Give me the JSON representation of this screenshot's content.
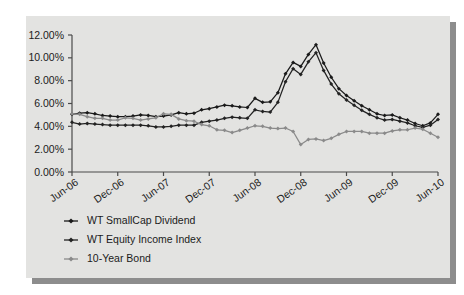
{
  "chart_data": {
    "type": "line",
    "title": "",
    "subtitle": "",
    "xlabel": "",
    "ylabel": "",
    "grid": false,
    "legend_position": "bottom-left",
    "ylim": [
      0,
      12
    ],
    "ytick_labels": [
      "0.00%",
      "2.00%",
      "4.00%",
      "6.00%",
      "8.00%",
      "10.00%",
      "12.00%"
    ],
    "ytick_values": [
      0,
      2,
      4,
      6,
      8,
      10,
      12
    ],
    "xtick_labels": [
      "Jun-06",
      "Dec-06",
      "Jun-07",
      "Dec-07",
      "Jun-08",
      "Dec-08",
      "Jun-09",
      "Dec-09",
      "Jun-10"
    ],
    "x": [
      "Jun-06",
      "Jul-06",
      "Aug-06",
      "Sep-06",
      "Oct-06",
      "Nov-06",
      "Dec-06",
      "Jan-07",
      "Feb-07",
      "Mar-07",
      "Apr-07",
      "May-07",
      "Jun-07",
      "Jul-07",
      "Aug-07",
      "Sep-07",
      "Oct-07",
      "Nov-07",
      "Dec-07",
      "Jan-08",
      "Feb-08",
      "Mar-08",
      "Apr-08",
      "May-08",
      "Jun-08",
      "Jul-08",
      "Aug-08",
      "Sep-08",
      "Oct-08",
      "Nov-08",
      "Dec-08",
      "Jan-09",
      "Feb-09",
      "Mar-09",
      "Apr-09",
      "May-09",
      "Jun-09",
      "Jul-09",
      "Aug-09",
      "Sep-09",
      "Oct-09",
      "Nov-09",
      "Dec-09",
      "Jan-10",
      "Feb-10",
      "Mar-10",
      "Apr-10",
      "May-10",
      "Jun-10"
    ],
    "series": [
      {
        "name": "WT SmallCap Dividend",
        "color": "#1a1a1a",
        "marker": "diamond",
        "values": [
          5.05,
          5.15,
          5.2,
          5.1,
          4.95,
          4.9,
          4.85,
          4.85,
          4.9,
          5.0,
          4.95,
          4.85,
          4.9,
          5.0,
          5.2,
          5.1,
          5.15,
          5.45,
          5.55,
          5.7,
          5.85,
          5.8,
          5.7,
          5.65,
          6.45,
          6.1,
          6.15,
          6.95,
          8.6,
          9.6,
          9.25,
          10.3,
          11.15,
          9.55,
          8.3,
          7.3,
          6.7,
          6.25,
          5.8,
          5.45,
          5.1,
          4.95,
          5.0,
          4.75,
          4.55,
          4.25,
          4.05,
          4.3,
          5.05
        ]
      },
      {
        "name": "WT Equity Income Index",
        "color": "#232323",
        "marker": "diamond",
        "values": [
          4.35,
          4.2,
          4.25,
          4.2,
          4.15,
          4.1,
          4.1,
          4.1,
          4.1,
          4.1,
          4.05,
          3.95,
          3.95,
          4.0,
          4.1,
          4.1,
          4.1,
          4.35,
          4.45,
          4.55,
          4.7,
          4.8,
          4.75,
          4.7,
          5.45,
          5.3,
          5.25,
          6.1,
          7.9,
          9.05,
          8.55,
          9.65,
          10.45,
          8.9,
          7.7,
          6.85,
          6.3,
          5.85,
          5.4,
          5.05,
          4.75,
          4.55,
          4.6,
          4.45,
          4.3,
          4.05,
          3.9,
          4.1,
          4.6
        ]
      },
      {
        "name": "10-Year Bond",
        "color": "#8a8a8a",
        "marker": "diamond",
        "values": [
          5.1,
          5.05,
          4.85,
          4.7,
          4.7,
          4.55,
          4.55,
          4.75,
          4.7,
          4.55,
          4.65,
          4.75,
          5.1,
          5.05,
          4.65,
          4.5,
          4.45,
          4.15,
          4.05,
          3.7,
          3.65,
          3.45,
          3.65,
          3.85,
          4.05,
          4.0,
          3.85,
          3.8,
          3.85,
          3.55,
          2.4,
          2.85,
          2.9,
          2.75,
          2.95,
          3.3,
          3.55,
          3.55,
          3.55,
          3.4,
          3.4,
          3.4,
          3.6,
          3.7,
          3.7,
          3.85,
          3.75,
          3.4,
          3.05
        ]
      }
    ],
    "legend": [
      {
        "label": "WT SmallCap Dividend",
        "color": "#1a1a1a"
      },
      {
        "label": "WT Equity Income Index",
        "color": "#232323"
      },
      {
        "label": "10-Year Bond",
        "color": "#8a8a8a"
      }
    ],
    "colors": {
      "panel_background": "#e3e3e1",
      "page_background": "#ffffff",
      "axis": "#4a4a4a",
      "text": "#1b1b1b",
      "shadow": "#8d8d8d"
    }
  }
}
